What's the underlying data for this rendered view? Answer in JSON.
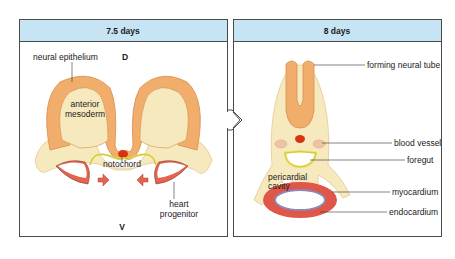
{
  "colors": {
    "header_bg": "#c7e4f5",
    "neural_epithelium": "#f0ad6b",
    "mesoderm": "#f7e9be",
    "notochord": "#d8320f",
    "endoderm": "#e8e35a",
    "heart_progenitor": "#e5634f",
    "myocardium": "#e0574a",
    "endocardium": "#8d86b8",
    "blood_vessel": "#efc3a8"
  },
  "panels": [
    {
      "title": "7.5 days",
      "labels": {
        "neural_epithelium": "neural epithelium",
        "dorsal": "D",
        "anterior": "anterior",
        "mesoderm": "mesoderm",
        "notochord": "notochord",
        "heart": "heart",
        "progenitor": "progenitor",
        "ventral": "V"
      }
    },
    {
      "title": "8 days",
      "labels": {
        "forming_neural_tube": "forming neural tube",
        "blood_vessel": "blood vessel",
        "foregut": "foregut",
        "pericardial": "pericardial",
        "cavity": "cavity",
        "myocardium": "myocardium",
        "endocardium": "endocardium"
      }
    }
  ],
  "connector": {
    "icon": "right-arrow-icon"
  }
}
